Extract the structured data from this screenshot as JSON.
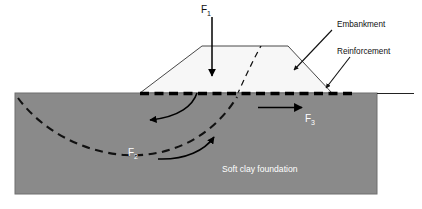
{
  "figure": {
    "background_color": "#ffffff"
  },
  "colors": {
    "foundation_fill": "#8a8a8a",
    "foundation_stroke": "#6f6f6f",
    "embankment_fill": "#f7f7f7",
    "embankment_stroke": "#333333",
    "reinforcement": "#000000",
    "slip_surface": "#111111",
    "force_arrow": "#000000",
    "leader": "#111111",
    "label_text": "#111111",
    "label_text_on_fill": "#ffffff"
  },
  "labels": {
    "embankment": "Embankment",
    "reinforcement": "Reinforcement",
    "foundation": "Soft clay foundation"
  },
  "forces": [
    {
      "id": "F1",
      "symbol": "F",
      "subscript": "1",
      "description": "Vertical embankment load applied downward at the crest",
      "direction": "down",
      "text_color": "#111111"
    },
    {
      "id": "F2",
      "symbol": "F",
      "subscript": "2",
      "description": "Resisting shear force along the circular slip surface in the soft clay",
      "direction": "curved",
      "text_color": "#ffffff"
    },
    {
      "id": "F3",
      "symbol": "F",
      "subscript": "3",
      "description": "Outward lateral thrust resisted by the basal reinforcement",
      "direction": "right",
      "text_color": "#ffffff"
    }
  ],
  "annotations": [
    {
      "id": "embankment-callout",
      "label": "Embankment",
      "points_to": "embankment body right slope"
    },
    {
      "id": "reinforcement-callout",
      "label": "Reinforcement",
      "points_to": "basal dashed reinforcement layer"
    }
  ],
  "elements": {
    "ground_line": "horizontal ground surface extending right of the foundation block",
    "slip_surface": "dashed circular failure arc through foundation and embankment",
    "reinforcement_layer": "heavy dashed horizontal line at embankment base"
  }
}
